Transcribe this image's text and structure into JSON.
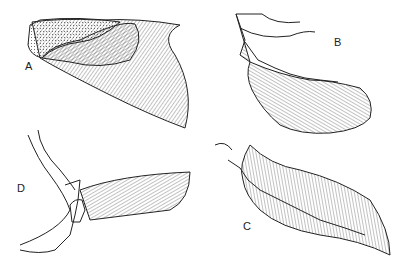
{
  "figure": {
    "panels": [
      {
        "label": "A",
        "description": "fin with scaly base and fan of rays"
      },
      {
        "label": "B",
        "description": "lobed fin with jointed axis and radiating rays"
      },
      {
        "label": "C",
        "description": "elongate leaf-shaped lobed fin with central axis"
      },
      {
        "label": "D",
        "description": "pectoral girdle with fan-shaped ray fin"
      }
    ],
    "colors": {
      "ink": "#222222",
      "background": "#ffffff"
    }
  }
}
